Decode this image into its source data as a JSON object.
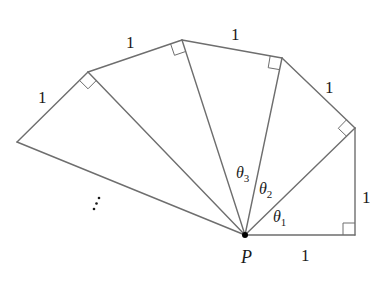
{
  "diagram": {
    "point_label": "P",
    "side_labels": [
      "1",
      "1",
      "1",
      "1",
      "1",
      "1"
    ],
    "angle_labels": [
      {
        "symbol": "θ",
        "sub": "1"
      },
      {
        "symbol": "θ",
        "sub": "2"
      },
      {
        "symbol": "θ",
        "sub": "3"
      }
    ],
    "continuation": "⋮",
    "colors": {
      "line": "#6e6e6e",
      "text": "#1a1a1a",
      "point": "#000000"
    }
  }
}
